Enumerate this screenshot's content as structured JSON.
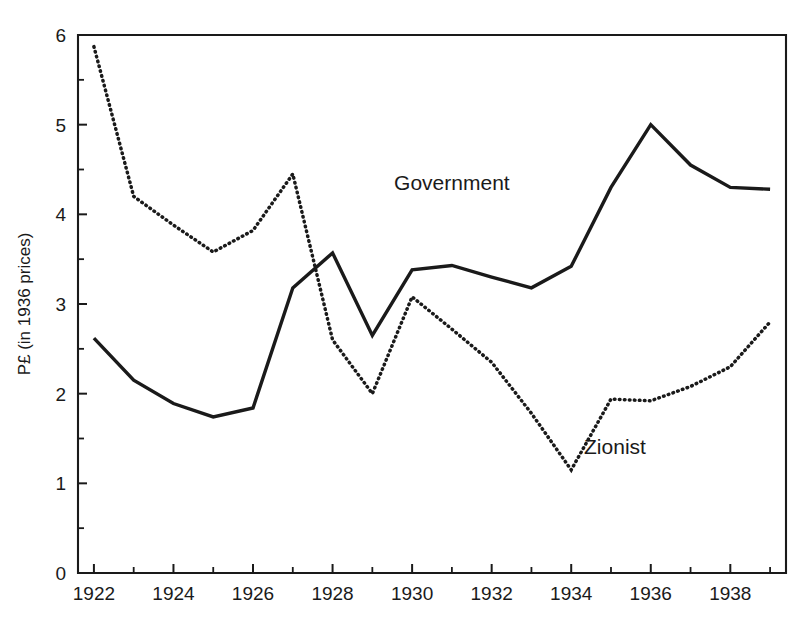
{
  "chart_data": {
    "type": "line",
    "title": "",
    "subtitle": "",
    "xlabel": "",
    "ylabel": "P£ (in 1936 prices)",
    "xlim": [
      1921.6,
      1939.4
    ],
    "ylim": [
      0,
      6
    ],
    "grid": false,
    "legend_position": "inline-annotation",
    "x_tick_labels": [
      "1922",
      "1924",
      "1926",
      "1928",
      "1930",
      "1932",
      "1934",
      "1936",
      "1938"
    ],
    "x_tick_values": [
      1922,
      1924,
      1926,
      1928,
      1930,
      1932,
      1934,
      1936,
      1938
    ],
    "x_minor_tick_values": [
      1923,
      1925,
      1927,
      1929,
      1931,
      1933,
      1935,
      1937,
      1939
    ],
    "y_tick_labels": [
      "0",
      "1",
      "2",
      "3",
      "4",
      "5",
      "6"
    ],
    "y_tick_values": [
      0,
      1,
      2,
      3,
      4,
      5,
      6
    ],
    "y_minor_tick_values": [
      0.5,
      1.5,
      2.5,
      3.5,
      4.5,
      5.5
    ],
    "x": [
      1922,
      1923,
      1924,
      1925,
      1926,
      1927,
      1928,
      1929,
      1930,
      1931,
      1932,
      1933,
      1934,
      1935,
      1936,
      1937,
      1938,
      1939
    ],
    "series": [
      {
        "name": "Government",
        "style": "solid",
        "color": "#1a1a1a",
        "values": [
          2.62,
          2.15,
          1.89,
          1.74,
          1.84,
          3.18,
          3.57,
          2.65,
          3.38,
          3.43,
          3.3,
          3.18,
          3.42,
          4.3,
          5.0,
          4.55,
          4.3,
          4.28
        ]
      },
      {
        "name": "Zionist",
        "style": "dotted",
        "color": "#1a1a1a",
        "values": [
          5.87,
          4.2,
          3.88,
          3.58,
          3.82,
          4.45,
          2.6,
          2.0,
          3.08,
          2.72,
          2.35,
          1.78,
          1.15,
          1.94,
          1.92,
          2.08,
          2.3,
          2.8
        ]
      }
    ],
    "annotations": [
      {
        "text": "Government",
        "x": 1931.0,
        "y": 4.27,
        "series": "Government"
      },
      {
        "text": "Zionist",
        "x": 1935.1,
        "y": 1.33,
        "series": "Zionist"
      }
    ]
  },
  "plot_geometry": {
    "left_px": 78,
    "right_px": 786,
    "top_px": 35,
    "bottom_px": 573
  }
}
